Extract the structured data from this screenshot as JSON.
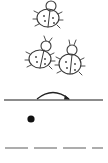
{
  "worksheet": {
    "illustration": {
      "subject": "ladybug",
      "count": 3
    },
    "guide": {
      "solid_line": true,
      "stroke_arrow_direction": "left-to-right",
      "start_dot": true,
      "dashed_line_segments": 4
    },
    "colors": {
      "ink": "#3a3a3a",
      "background": "#ffffff",
      "line": "#666666",
      "dot": "#111111"
    }
  }
}
